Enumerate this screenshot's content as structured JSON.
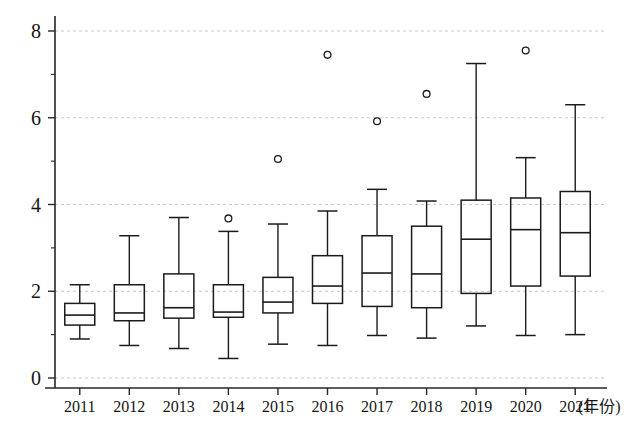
{
  "chart_data": {
    "type": "box",
    "title": "",
    "xlabel": "(年份)",
    "ylabel": "",
    "ylim": [
      0,
      8.35
    ],
    "yticks": [
      0,
      2,
      4,
      6,
      8
    ],
    "yticks_minor": [
      1,
      3,
      5,
      7
    ],
    "ytick_labels": [
      "0",
      "2",
      "4",
      "6",
      "8"
    ],
    "grid": true,
    "grid_axis": "y",
    "legend": "none",
    "categories": [
      "2011",
      "2012",
      "2013",
      "2014",
      "2015",
      "2016",
      "2017",
      "2018",
      "2019",
      "2020",
      "2021"
    ],
    "boxes": [
      {
        "category": "2011",
        "whisker_low": 0.9,
        "q1": 1.22,
        "median": 1.45,
        "q3": 1.72,
        "whisker_high": 2.15,
        "outliers": []
      },
      {
        "category": "2012",
        "whisker_low": 0.75,
        "q1": 1.32,
        "median": 1.5,
        "q3": 2.15,
        "whisker_high": 3.28,
        "outliers": []
      },
      {
        "category": "2013",
        "whisker_low": 0.68,
        "q1": 1.38,
        "median": 1.62,
        "q3": 2.4,
        "whisker_high": 3.7,
        "outliers": []
      },
      {
        "category": "2014",
        "whisker_low": 0.45,
        "q1": 1.4,
        "median": 1.52,
        "q3": 2.15,
        "whisker_high": 3.38,
        "outliers": [
          3.68
        ]
      },
      {
        "category": "2015",
        "whisker_low": 0.78,
        "q1": 1.5,
        "median": 1.75,
        "q3": 2.32,
        "whisker_high": 3.55,
        "outliers": [
          5.05
        ]
      },
      {
        "category": "2016",
        "whisker_low": 0.75,
        "q1": 1.72,
        "median": 2.12,
        "q3": 2.82,
        "whisker_high": 3.85,
        "outliers": [
          7.45
        ]
      },
      {
        "category": "2017",
        "whisker_low": 0.98,
        "q1": 1.65,
        "median": 2.42,
        "q3": 3.28,
        "whisker_high": 4.35,
        "outliers": [
          5.92
        ]
      },
      {
        "category": "2018",
        "whisker_low": 0.92,
        "q1": 1.62,
        "median": 2.4,
        "q3": 3.5,
        "whisker_high": 4.08,
        "outliers": [
          6.55
        ]
      },
      {
        "category": "2019",
        "whisker_low": 1.2,
        "q1": 1.95,
        "median": 3.2,
        "q3": 4.1,
        "whisker_high": 7.25,
        "outliers": []
      },
      {
        "category": "2020",
        "whisker_low": 0.98,
        "q1": 2.12,
        "median": 3.42,
        "q3": 4.15,
        "whisker_high": 5.08,
        "outliers": [
          7.55
        ]
      },
      {
        "category": "2021",
        "whisker_low": 1.0,
        "q1": 2.35,
        "median": 3.35,
        "q3": 4.3,
        "whisker_high": 6.3,
        "outliers": []
      }
    ]
  },
  "colors": {
    "background": "#ffffff",
    "axis": "#262626",
    "gridline": "#c9c9cc",
    "box_stroke": "#1b1b1b",
    "text": "#151515"
  }
}
